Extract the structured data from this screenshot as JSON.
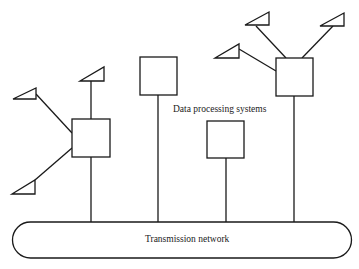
{
  "diagram": {
    "type": "network-topology",
    "labels": {
      "systems": "Data processing systems",
      "network": "Transmission network"
    },
    "nodes": [
      {
        "id": "system-1",
        "kind": "data-processing-system",
        "terminals": 3
      },
      {
        "id": "system-2",
        "kind": "data-processing-system",
        "terminals": 0
      },
      {
        "id": "system-3",
        "kind": "data-processing-system",
        "terminals": 0
      },
      {
        "id": "system-4",
        "kind": "data-processing-system",
        "terminals": 3
      }
    ],
    "edges": [
      {
        "from": "system-1",
        "to": "transmission-network"
      },
      {
        "from": "system-2",
        "to": "transmission-network"
      },
      {
        "from": "system-3",
        "to": "transmission-network"
      },
      {
        "from": "system-4",
        "to": "transmission-network"
      }
    ],
    "colors": {
      "stroke": "#1a1a1a",
      "background": "#ffffff"
    }
  }
}
